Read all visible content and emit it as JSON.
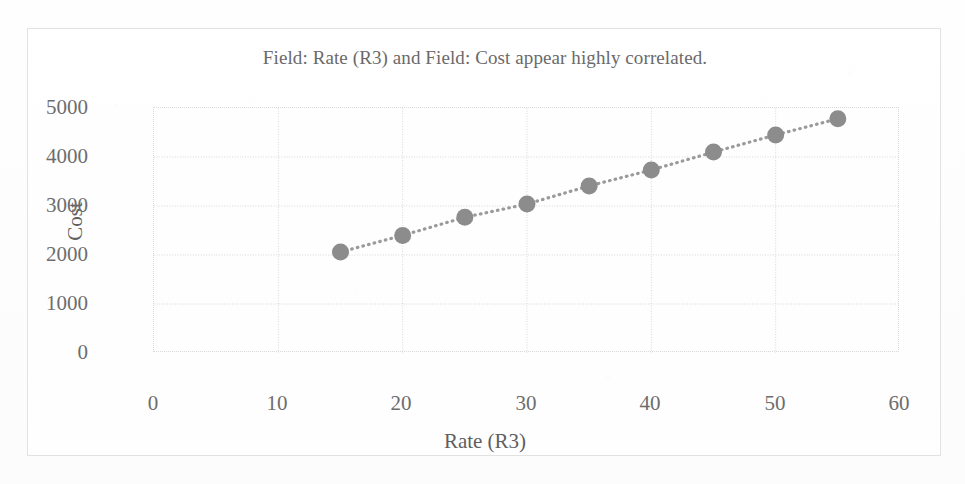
{
  "chart_data": {
    "type": "scatter",
    "title": "Field: Rate (R3) and Field: Cost appear highly correlated.",
    "xlabel": "Rate (R3)",
    "ylabel": "Cost",
    "xlim": [
      0,
      60
    ],
    "ylim": [
      0,
      5000
    ],
    "xticks": [
      0,
      10,
      20,
      30,
      40,
      50,
      60
    ],
    "yticks": [
      0,
      1000,
      2000,
      3000,
      4000,
      5000
    ],
    "xtick_labels": [
      "0",
      "10",
      "20",
      "30",
      "40",
      "50",
      "60"
    ],
    "ytick_labels": [
      "0",
      "1000",
      "2000",
      "3000",
      "4000",
      "5000"
    ],
    "grid": true,
    "grid_style": "dotted",
    "legend": false,
    "connected": true,
    "line_style": "dotted",
    "marker": "circle",
    "marker_color": "#8c8c8c",
    "line_color": "#9a9a9a",
    "grid_color": "#d8d8d8",
    "axis_label_color": "#6d6d6d",
    "title_color": "#6a6a6a",
    "frame_color": "#e2e2e2",
    "x": [
      15,
      20,
      25,
      30,
      35,
      40,
      45,
      50,
      55
    ],
    "y": [
      2060,
      2400,
      2770,
      3040,
      3410,
      3735,
      4100,
      4450,
      4780
    ],
    "series": [
      {
        "name": "Cost vs Rate (R3)",
        "points": [
          {
            "x": 15,
            "y": 2060
          },
          {
            "x": 20,
            "y": 2400
          },
          {
            "x": 25,
            "y": 2770
          },
          {
            "x": 30,
            "y": 3040
          },
          {
            "x": 35,
            "y": 3410
          },
          {
            "x": 40,
            "y": 3735
          },
          {
            "x": 45,
            "y": 4100
          },
          {
            "x": 50,
            "y": 4450
          },
          {
            "x": 55,
            "y": 4780
          }
        ]
      }
    ]
  }
}
